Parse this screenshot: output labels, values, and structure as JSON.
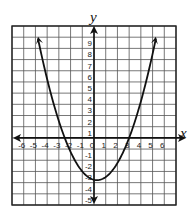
{
  "chart_data": {
    "type": "line",
    "title": "",
    "xlabel": "x",
    "ylabel": "y",
    "xlim": [
      -7,
      7
    ],
    "ylim": [
      -6,
      10
    ],
    "grid": true,
    "x_tick_labels": [
      "-6",
      "-5",
      "-4",
      "-3",
      "-2",
      "-1",
      "0",
      "1",
      "2",
      "3",
      "4",
      "5",
      "6"
    ],
    "y_tick_labels": [
      "9",
      "8",
      "7",
      "6",
      "5",
      "4",
      "3",
      "2",
      "1",
      "-1",
      "-2",
      "-3",
      "-4",
      "-5"
    ],
    "series": [
      {
        "name": "parabola",
        "equation": "y = (x + 2.5)(x - 3) / 2",
        "x_intercepts": [
          -2.5,
          3
        ],
        "vertex": [
          0.25,
          -3.78
        ],
        "x": [
          -4.8,
          -4,
          -3,
          -2.5,
          -2,
          -1,
          0,
          0.25,
          1,
          2,
          3,
          4,
          5,
          5.3
        ],
        "values": [
          9.0,
          6.75,
          3.0,
          0.0,
          -2.5,
          -5.25,
          -3.75,
          -3.78,
          -3.5,
          -2.25,
          0.0,
          3.25,
          7.5,
          9.0
        ],
        "arrows": "both ends"
      }
    ],
    "colors": {
      "grid": "#555555",
      "axes": "#111111",
      "curve": "#111111",
      "background": "#ffffff"
    }
  }
}
